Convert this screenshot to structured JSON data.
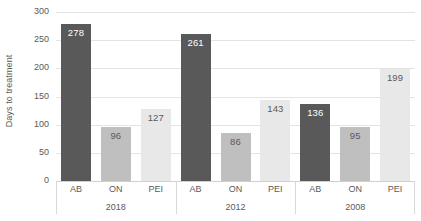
{
  "chart_data": {
    "type": "bar",
    "title": "",
    "xlabel": "",
    "ylabel": "Days to treatment",
    "ylim": [
      0,
      300
    ],
    "ytick_values": [
      300,
      250,
      200,
      150,
      100,
      50,
      0
    ],
    "ytick_labels": [
      "300",
      "250",
      "200",
      "150",
      "100",
      "50",
      "0"
    ],
    "grid": true,
    "legend": false,
    "categories": [
      "AB",
      "ON",
      "PEI"
    ],
    "groups": [
      "2018",
      "2012",
      "2008"
    ],
    "series": [
      {
        "name": "AB",
        "values": [
          278,
          261,
          136
        ],
        "color": "#595959"
      },
      {
        "name": "ON",
        "values": [
          96,
          86,
          95
        ],
        "color": "#bfbfbf"
      },
      {
        "name": "PEI",
        "values": [
          127,
          143,
          199
        ],
        "color": "#e8e8e8"
      }
    ],
    "bars": [
      {
        "group": "2018",
        "category": "AB",
        "value": 278,
        "label": "278",
        "color": "#595959",
        "label_color": "#ffffff"
      },
      {
        "group": "2018",
        "category": "ON",
        "value": 96,
        "label": "96",
        "color": "#bfbfbf",
        "label_color": "#5a5a5a"
      },
      {
        "group": "2018",
        "category": "PEI",
        "value": 127,
        "label": "127",
        "color": "#e8e8e8",
        "label_color": "#5a5a5a"
      },
      {
        "group": "2012",
        "category": "AB",
        "value": 261,
        "label": "261",
        "color": "#595959",
        "label_color": "#ffffff"
      },
      {
        "group": "2012",
        "category": "ON",
        "value": 86,
        "label": "86",
        "color": "#bfbfbf",
        "label_color": "#5a5a5a"
      },
      {
        "group": "2012",
        "category": "PEI",
        "value": 143,
        "label": "143",
        "color": "#e8e8e8",
        "label_color": "#5a5a5a"
      },
      {
        "group": "2008",
        "category": "AB",
        "value": 136,
        "label": "136",
        "color": "#595959",
        "label_color": "#ffffff"
      },
      {
        "group": "2008",
        "category": "ON",
        "value": 95,
        "label": "95",
        "color": "#bfbfbf",
        "label_color": "#5a5a5a"
      },
      {
        "group": "2008",
        "category": "PEI",
        "value": 199,
        "label": "199",
        "color": "#e8e8e8",
        "label_color": "#5a5a5a"
      }
    ],
    "colors": {
      "gridline": "#e3e3e3",
      "baseline": "#d0d0d0",
      "text": "#5a5a5a",
      "background": "#ffffff"
    }
  }
}
